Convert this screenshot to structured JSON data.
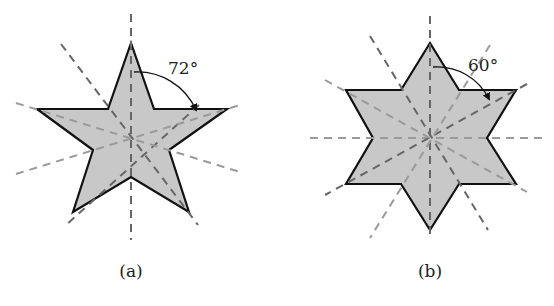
{
  "figures": [
    {
      "id": "a",
      "caption": "(a)",
      "shape": "five-pointed star",
      "symmetry_axes": 5,
      "rotation_angle_label": "72°"
    },
    {
      "id": "b",
      "caption": "(b)",
      "shape": "six-pointed star",
      "symmetry_axes": 6,
      "rotation_angle_label": "60°"
    }
  ],
  "colors": {
    "fill": "#c8c8c8",
    "outline": "#111111",
    "axis_dark": "#666666",
    "axis_light": "#9a9a9a"
  }
}
